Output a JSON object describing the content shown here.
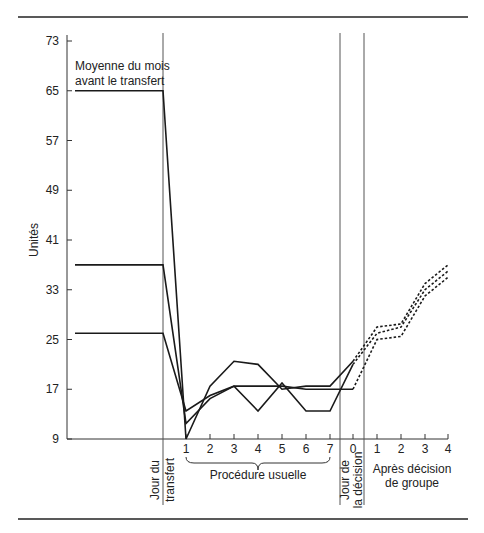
{
  "chart_data": {
    "type": "line",
    "title": "",
    "ylabel": "Unités",
    "xlabel": "",
    "ylim": [
      9,
      73
    ],
    "yticks": [
      9,
      17,
      25,
      33,
      41,
      49,
      57,
      65,
      73
    ],
    "grid": false,
    "annotations": {
      "baseline_label_line1": "Moyenne du mois",
      "baseline_label_line2": "avant le transfert",
      "transfer_day_line1": "Jour du",
      "transfer_day_line2": "transfert",
      "usual_procedure": "Procédure usuelle",
      "decision_day_line1": "Jour de",
      "decision_day_line2": "la décision",
      "after_decision_line1": "Après décision",
      "after_decision_line2": "de groupe"
    },
    "x_categories": [
      "Avant",
      "Transfert",
      "1",
      "2",
      "3",
      "4",
      "5",
      "6",
      "7",
      "0",
      "1",
      "2",
      "3",
      "4"
    ],
    "x_tick_labels": [
      "1",
      "2",
      "3",
      "4",
      "5",
      "6",
      "7",
      "0",
      "1",
      "2",
      "3",
      "4"
    ],
    "series": [
      {
        "name": "Groupe A",
        "style": "solid then dashed after decision",
        "baseline": 65,
        "values_usual": [
          9,
          17.5,
          21.5,
          21,
          17,
          17.5,
          17.5
        ],
        "decision_day": 21.5,
        "values_after": [
          27,
          27.5,
          34,
          37
        ]
      },
      {
        "name": "Groupe B",
        "style": "solid then dashed after decision",
        "baseline": 37,
        "values_usual": [
          11.5,
          15.5,
          17.5,
          13.5,
          18,
          13.5,
          13.5
        ],
        "decision_day": 21,
        "values_after": [
          26,
          27,
          33,
          36
        ]
      },
      {
        "name": "Groupe C",
        "style": "solid then dashed after decision",
        "baseline": 26,
        "values_usual": [
          13.5,
          16,
          17.5,
          17.5,
          17.5,
          17,
          17
        ],
        "decision_day": 17,
        "values_after": [
          25,
          25.5,
          32,
          35
        ]
      }
    ]
  }
}
